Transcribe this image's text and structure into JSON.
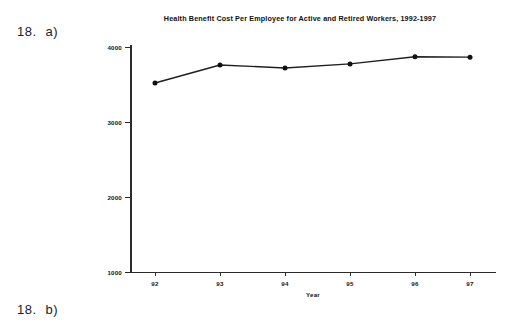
{
  "exercise": {
    "part_a": {
      "number": "18.",
      "letter": "a)"
    },
    "part_b": {
      "number": "18.",
      "letter": "b)"
    }
  },
  "chart_data": {
    "type": "line",
    "title": "Health Benefit Cost Per Employee for Active and Retired Workers, 1992-1997",
    "xlabel": "Year",
    "ylabel": "Cost (dollars)",
    "categories": [
      "92",
      "93",
      "94",
      "95",
      "96",
      "97"
    ],
    "values": [
      3520,
      3760,
      3720,
      3775,
      3870,
      3865
    ],
    "series": [
      {
        "name": "Health benefit cost per employee",
        "values": [
          3520,
          3760,
          3720,
          3775,
          3870,
          3865
        ]
      }
    ],
    "ylim": [
      1000,
      4000
    ],
    "yticks": [
      "1000",
      "2000",
      "3000",
      "4000"
    ],
    "ytick_values": [
      1000,
      2000,
      3000,
      4000
    ],
    "xticks": [
      "92",
      "93",
      "94",
      "95",
      "96",
      "97"
    ],
    "grid": false,
    "legend": false,
    "marker": "filled-circle",
    "line_color": "#1f1f1f",
    "marker_color": "#111111",
    "background_color": "#ffffff"
  }
}
